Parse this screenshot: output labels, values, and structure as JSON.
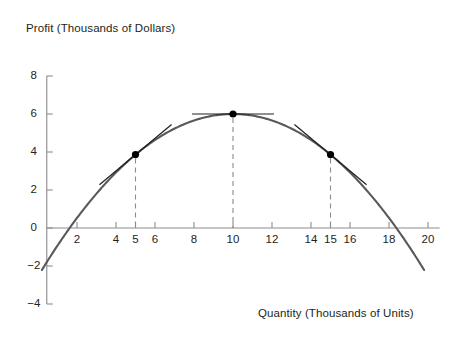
{
  "chart_data": {
    "type": "line",
    "title": "",
    "xlabel": "Quantity (Thousands of Units)",
    "ylabel": "Profit (Thousands of Dollars)",
    "xlim": [
      0,
      20
    ],
    "ylim": [
      -4,
      8
    ],
    "grid": false,
    "legend": null,
    "x_ticks": [
      2,
      4,
      5,
      6,
      8,
      10,
      12,
      14,
      15,
      16,
      18,
      20
    ],
    "x_tick_labels": [
      "2",
      "4",
      "5",
      "6",
      "8",
      "10",
      "12",
      "14",
      "15",
      "16",
      "18",
      "20"
    ],
    "y_ticks": [
      -4,
      -2,
      0,
      2,
      4,
      6,
      8
    ],
    "y_tick_labels": [
      "−4",
      "−2",
      "0",
      "2",
      "4",
      "6",
      "8"
    ],
    "curve": {
      "name": "Profit curve",
      "shape": "parabola",
      "vertex": [
        10,
        6
      ],
      "color": "#59595b",
      "x_range": [
        0.2,
        19.8
      ],
      "points": [
        [
          0.2,
          -2.4
        ],
        [
          1,
          -0.9
        ],
        [
          2,
          0.6
        ],
        [
          3,
          2.0
        ],
        [
          4,
          3.1
        ],
        [
          5,
          4.0
        ],
        [
          6,
          4.7
        ],
        [
          7,
          5.2
        ],
        [
          8,
          5.6
        ],
        [
          9,
          5.9
        ],
        [
          10,
          6.0
        ],
        [
          11,
          5.9
        ],
        [
          12,
          5.6
        ],
        [
          13,
          5.2
        ],
        [
          14,
          4.7
        ],
        [
          15,
          4.0
        ],
        [
          16,
          3.1
        ],
        [
          17,
          2.0
        ],
        [
          18,
          0.6
        ],
        [
          19,
          -0.9
        ],
        [
          19.8,
          -2.4
        ]
      ]
    },
    "marked_points": [
      {
        "label": "Point at quantity 5",
        "x": 5,
        "y": 4,
        "tangent_slope": "positive",
        "dashed_drop_line": true
      },
      {
        "label": "Maximum profit point",
        "x": 10,
        "y": 6,
        "tangent_slope": "zero",
        "dashed_drop_line": true
      },
      {
        "label": "Point at quantity 15",
        "x": 15,
        "y": 3.75,
        "tangent_slope": "negative",
        "dashed_drop_line": true
      }
    ],
    "colors": {
      "curve": "#59595b",
      "axis": "#8c8c8e",
      "tangent": "#231f20",
      "marker": "#000000",
      "dashed": "#8c8c8e",
      "text": "#231f20",
      "background": "#ffffff"
    }
  },
  "axis_titles": {
    "y": "Profit (Thousands of Dollars)",
    "x": "Quantity (Thousands of Units)"
  }
}
